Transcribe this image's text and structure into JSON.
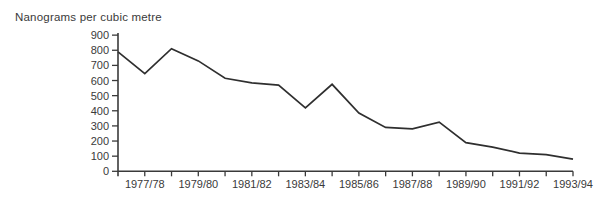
{
  "figure": {
    "background_color": "#ffffff"
  },
  "chart_data": {
    "type": "line",
    "title": "Nanograms per cubic metre",
    "xlabel": "",
    "ylabel": "Nanograms per cubic metre",
    "ylim": [
      0,
      900
    ],
    "y_ticks": [
      0,
      100,
      200,
      300,
      400,
      500,
      600,
      700,
      800,
      900
    ],
    "x_tick_labels": [
      "1977/78",
      "1979/80",
      "1981/82",
      "1983/84",
      "1985/86",
      "1987/88",
      "1989/90",
      "1991/92",
      "1993/94"
    ],
    "x_minor_tick_intervals": 17,
    "x_labels_every_nth_tick": 2,
    "grid": false,
    "legend": "none",
    "series": [
      {
        "name": "airborne lead concentration",
        "values": [
          790,
          645,
          810,
          730,
          615,
          585,
          570,
          420,
          575,
          385,
          290,
          280,
          325,
          190,
          160,
          120,
          110,
          80
        ]
      }
    ],
    "layout_note": "single black polyline; first point sits on the y-axis, then one point per yearly tick through 1993/94; year labels appear under every second tick",
    "line_color": "#2f2f2f",
    "axis_color": "#3a3a3a",
    "text_color": "#3a3a3a"
  }
}
